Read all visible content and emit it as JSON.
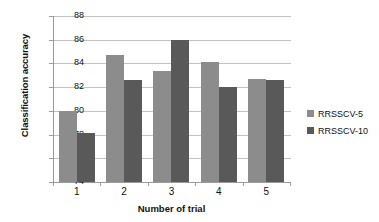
{
  "chart_data": {
    "type": "bar",
    "title": "",
    "xlabel": "Number of trial",
    "ylabel": "Classification accuracy",
    "categories": [
      "1",
      "2",
      "3",
      "4",
      "5"
    ],
    "series": [
      {
        "name": "RRSSCV-5",
        "values": [
          80.0,
          84.7,
          83.4,
          84.1,
          82.7
        ],
        "color": "#8c8c8c"
      },
      {
        "name": "RRSSCV-10",
        "values": [
          78.1,
          82.6,
          86.0,
          82.0,
          82.6
        ],
        "color": "#595959"
      }
    ],
    "ylim": [
      74,
      88
    ],
    "yticks": [
      74,
      76,
      78,
      80,
      82,
      84,
      86,
      88
    ],
    "grid": true,
    "legend_position": "right",
    "background": "#ffffff"
  }
}
